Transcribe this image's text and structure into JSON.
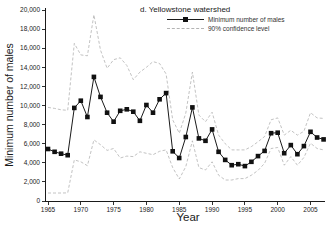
{
  "chart": {
    "title": "d. Yellowstone watershed",
    "xlabel": "Year",
    "ylabel": "Minimum number of males",
    "legend": [
      {
        "label": "Minimum number of males",
        "style": "solid-square"
      },
      {
        "label": "90% confidence level",
        "style": "dashed"
      }
    ]
  },
  "chart_data": {
    "type": "line",
    "title": "d. Yellowstone watershed",
    "xlabel": "Year",
    "ylabel": "Minimum number of males",
    "xlim": [
      1964,
      2008
    ],
    "ylim": [
      0,
      20000
    ],
    "grid": false,
    "legend_position": "top-right",
    "x_ticks": [
      1965,
      1970,
      1975,
      1980,
      1985,
      1990,
      1995,
      2000,
      2005
    ],
    "y_ticks": [
      0,
      2000,
      4000,
      6000,
      8000,
      10000,
      12000,
      14000,
      16000,
      18000,
      20000
    ],
    "y_tick_labels": [
      "0",
      "2,000",
      "4,000",
      "6,000",
      "8,000",
      "10,000",
      "12,000",
      "14,000",
      "16,000",
      "18,000",
      "20,000"
    ],
    "x": [
      1965,
      1966,
      1967,
      1968,
      1969,
      1970,
      1971,
      1972,
      1973,
      1974,
      1975,
      1976,
      1977,
      1978,
      1979,
      1980,
      1981,
      1982,
      1983,
      1984,
      1985,
      1986,
      1987,
      1988,
      1989,
      1990,
      1991,
      1992,
      1993,
      1994,
      1995,
      1996,
      1997,
      1998,
      1999,
      2000,
      2001,
      2002,
      2003,
      2004,
      2005,
      2006,
      2007
    ],
    "series": [
      {
        "name": "Minimum number of males",
        "style": "solid",
        "marker": "square",
        "color": "#1a1a1a",
        "values": [
          5450,
          5150,
          4950,
          4800,
          9750,
          10500,
          8800,
          13000,
          10900,
          9250,
          8300,
          9450,
          9600,
          9350,
          8400,
          10050,
          9250,
          10650,
          11300,
          5200,
          4500,
          6700,
          9800,
          6550,
          6300,
          7500,
          5150,
          4300,
          3750,
          3850,
          3650,
          4100,
          4700,
          5250,
          7100,
          7150,
          5000,
          5850,
          4900,
          5750,
          7250,
          6650,
          6450
        ]
      },
      {
        "name": "90% confidence level (upper)",
        "style": "dashed",
        "marker": "none",
        "color": "#b3b3b3",
        "values": [
          9800,
          9700,
          9550,
          9500,
          16500,
          15300,
          15200,
          19500,
          15800,
          13900,
          14800,
          15000,
          14200,
          12700,
          13500,
          14000,
          14600,
          14400,
          13300,
          8500,
          7100,
          9200,
          13500,
          9000,
          8300,
          9300,
          6900,
          6000,
          5350,
          5350,
          5350,
          5700,
          6200,
          6750,
          8500,
          8700,
          6900,
          7400,
          6900,
          7300,
          9250,
          8700,
          8650
        ]
      },
      {
        "name": "90% confidence level (lower)",
        "style": "dashed",
        "marker": "none",
        "color": "#b3b3b3",
        "values": [
          840,
          840,
          840,
          850,
          4300,
          4100,
          3700,
          6400,
          5900,
          5300,
          5500,
          4500,
          4700,
          4650,
          5150,
          5000,
          4850,
          5200,
          5350,
          3500,
          2300,
          3600,
          6300,
          3500,
          3250,
          4100,
          2700,
          2200,
          2200,
          2350,
          2350,
          2700,
          3200,
          3950,
          5500,
          5600,
          3750,
          4650,
          3750,
          4550,
          6050,
          5500,
          5350
        ]
      }
    ]
  }
}
